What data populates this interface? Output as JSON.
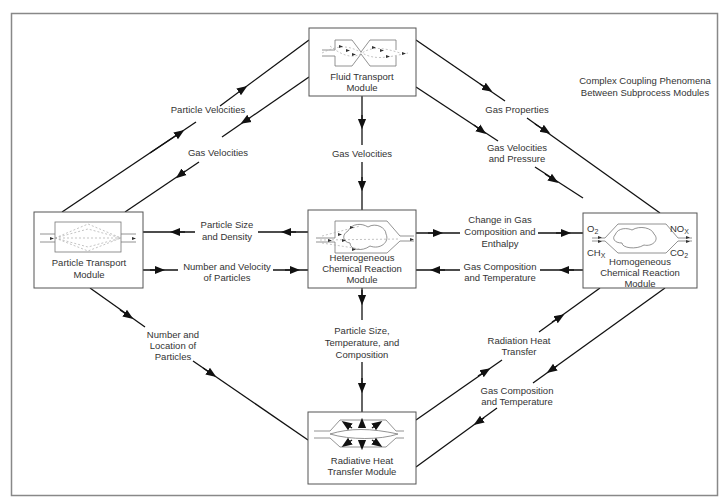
{
  "diagram": {
    "title_line1": "Complex Coupling Phenomena",
    "title_line2": "Between Subprocess Modules",
    "modules": {
      "fluid": {
        "line1": "Fluid Transport",
        "line2": "Module"
      },
      "particle": {
        "line1": "Particle Transport",
        "line2": "Module"
      },
      "hetero": {
        "line1": "Heterogeneous",
        "line2": "Chemical Reaction",
        "line3": "Module"
      },
      "homog": {
        "line1": "Homogeneous",
        "line2": "Chemical Reaction",
        "line3": "Module",
        "o2": "O",
        "o2sub": "2",
        "chx": "CH",
        "chxsub": "X",
        "nox": "NO",
        "noxsub": "X",
        "co2": "CO",
        "co2sub": "2"
      },
      "radiative": {
        "line1": "Radiative Heat",
        "line2": "Transfer Module"
      }
    },
    "edges": {
      "particle_velocities": "Particle Velocities",
      "gas_velocities_left": "Gas Velocities",
      "gas_velocities_center": "Gas Velocities",
      "gas_properties": "Gas Properties",
      "gas_vel_pressure_1": "Gas Velocities",
      "gas_vel_pressure_2": "and Pressure",
      "psd_1": "Particle Size",
      "psd_2": "and Density",
      "nvp_1": "Number and Velocity",
      "nvp_2": "of Particles",
      "cgc_1": "Change in Gas",
      "cgc_2": "Composition and",
      "cgc_3": "Enthalpy",
      "gct_mid_1": "Gas Composition",
      "gct_mid_2": "and Temperature",
      "nlp_1": "Number and",
      "nlp_2": "Location of",
      "nlp_3": "Particles",
      "pstc_1": "Particle Size,",
      "pstc_2": "Temperature, and",
      "pstc_3": "Composition",
      "rht_1": "Radiation Heat",
      "rht_2": "Transfer",
      "gct_low_1": "Gas Composition",
      "gct_low_2": "and Temperature"
    }
  }
}
